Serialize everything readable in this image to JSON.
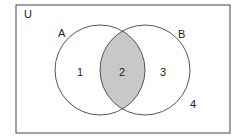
{
  "diagram": {
    "type": "venn",
    "universe_label": "U",
    "sets": [
      {
        "label": "A",
        "cx": 100,
        "cy": 70,
        "r": 45
      },
      {
        "label": "B",
        "cx": 145,
        "cy": 70,
        "r": 45
      }
    ],
    "regions": [
      {
        "label": "1",
        "description": "A only"
      },
      {
        "label": "2",
        "description": "A and B (shaded)"
      },
      {
        "label": "3",
        "description": "B only"
      },
      {
        "label": "4",
        "description": "outside A and B"
      }
    ],
    "shaded_region": "2",
    "colors": {
      "line": "#555555",
      "shade": "#c8c8c8",
      "border": "#444444"
    }
  }
}
